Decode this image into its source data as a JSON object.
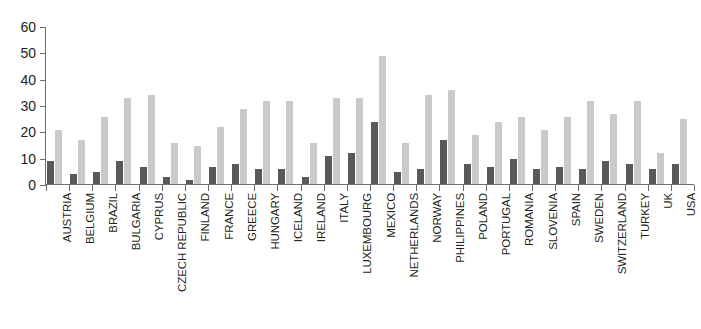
{
  "chart_data": {
    "type": "bar",
    "title": "",
    "subtitle": "",
    "xlabel": "",
    "ylabel": "",
    "ylim": [
      0,
      60
    ],
    "yticks": [
      0,
      10,
      20,
      30,
      40,
      50,
      60
    ],
    "grid": false,
    "legend": "none",
    "orientation": "vertical",
    "grouping": "grouped",
    "categories": [
      "AUSTRIA",
      "BELGIUM",
      "BRAZIL",
      "BULGARIA",
      "CYPRUS",
      "CZECH REPUBLIC",
      "FINLAND",
      "FRANCE",
      "GREECE",
      "HUNGARY",
      "ICELAND",
      "IRELAND",
      "ITALY",
      "LUXEMBOURG",
      "MEXICO",
      "NETHERLANDS",
      "NORWAY",
      "PHILIPPINES",
      "POLAND",
      "PORTUGAL",
      "ROMANIA",
      "SLOVENIA",
      "SPAIN",
      "SWEDEN",
      "SWITZERLAND",
      "TURKEY",
      "UK",
      "USA"
    ],
    "series": [
      {
        "name": "series-dark",
        "color": "#59595b",
        "values": [
          9,
          4,
          5,
          9,
          7,
          3,
          2,
          7,
          8,
          6,
          6,
          3,
          11,
          12,
          24,
          5,
          6,
          17,
          8,
          7,
          10,
          6,
          7,
          6,
          9,
          8,
          6,
          8
        ]
      },
      {
        "name": "series-light",
        "color": "#c9cacb",
        "values": [
          21,
          17,
          26,
          33,
          34,
          16,
          15,
          22,
          29,
          32,
          32,
          16,
          33,
          33,
          49,
          16,
          34,
          36,
          19,
          24,
          26,
          21,
          26,
          32,
          27,
          32,
          12,
          25
        ]
      }
    ]
  },
  "axis": {
    "y_tick_labels": [
      "60",
      "50",
      "40",
      "30",
      "20",
      "10",
      "0"
    ]
  },
  "colors": {
    "dark_bar": "#59595b",
    "light_bar": "#c9cacb",
    "axis": "#6d6e71",
    "text": "#231f20",
    "background": "#ffffff"
  }
}
